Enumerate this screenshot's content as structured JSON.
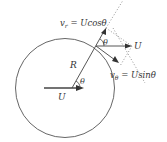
{
  "diagram": {
    "labels": {
      "vr": "v",
      "vr_sub": "r",
      "vr_eq": " = Ucosθ",
      "vtheta": "v",
      "vtheta_sub": "θ",
      "vtheta_eq": " = Usinθ",
      "U_right": "U",
      "U_center": "U",
      "R": "R",
      "theta_top": "θ",
      "theta_center": "θ"
    },
    "colors": {
      "stroke": "#444444",
      "dotted": "#888888",
      "text": "#333333"
    }
  }
}
